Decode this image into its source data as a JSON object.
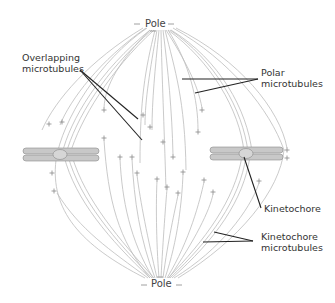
{
  "labels": {
    "pole_top": "Pole",
    "pole_bottom": "Pole",
    "overlapping_line1": "Overlapping",
    "overlapping_line2": "microtubules",
    "polar_line1": "Polar",
    "polar_line2": "microtubules",
    "kinetochore": "Kinetochore",
    "kinetochore_mt_line1": "Kinetochore",
    "kinetochore_mt_line2": "microtubules"
  },
  "signs": {
    "minus": "–",
    "plus": "+"
  },
  "colors": {
    "microtubule": "#bdbdbd",
    "chromosome_fill": "#c8c8c8",
    "chromosome_stroke": "#8a8a8a",
    "pointer": "#222222",
    "text": "#333333"
  },
  "poles": [
    {
      "name": "top",
      "x": 160,
      "y": 30
    },
    {
      "name": "bottom",
      "x": 160,
      "y": 278
    }
  ],
  "chromosomes": [
    {
      "side": "left",
      "cx": 60,
      "cy": 154
    },
    {
      "side": "right",
      "cx": 246,
      "cy": 152
    }
  ],
  "plus_ends": [
    [
      49,
      124
    ],
    [
      62,
      122
    ],
    [
      104,
      110
    ],
    [
      104,
      138
    ],
    [
      143,
      115
    ],
    [
      150,
      127
    ],
    [
      163,
      142
    ],
    [
      120,
      157
    ],
    [
      132,
      157
    ],
    [
      173,
      157
    ],
    [
      137,
      173
    ],
    [
      183,
      172
    ],
    [
      157,
      179
    ],
    [
      167,
      187
    ],
    [
      178,
      193
    ],
    [
      52,
      173
    ],
    [
      54,
      191
    ],
    [
      202,
      110
    ],
    [
      198,
      132
    ],
    [
      204,
      180
    ],
    [
      213,
      192
    ],
    [
      259,
      181
    ],
    [
      287,
      150
    ],
    [
      287,
      158
    ]
  ]
}
